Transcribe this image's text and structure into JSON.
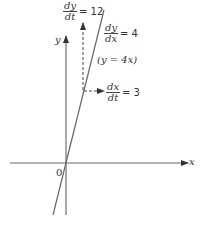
{
  "diagram": {
    "axes": {
      "x_label": "x",
      "y_label": "y",
      "origin_label": "0"
    },
    "line": {
      "equation": "(y = 4x)",
      "slope_label": {
        "num": "dy",
        "den": "dx",
        "value": "= 4"
      }
    },
    "rates": {
      "dy_dt": {
        "num": "dy",
        "den": "dt",
        "value": "= 12"
      },
      "dx_dt": {
        "num": "dx",
        "den": "dt",
        "value": "= 3"
      }
    },
    "colors": {
      "stroke": "#555555",
      "text": "#333333"
    }
  }
}
